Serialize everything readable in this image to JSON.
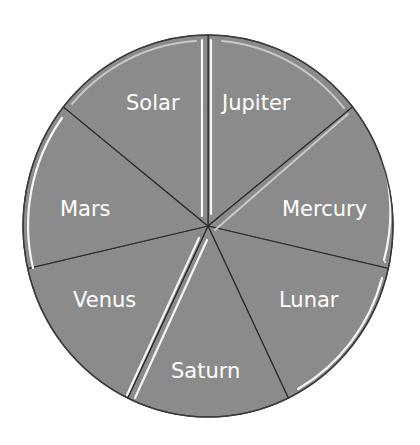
{
  "chart_data": {
    "type": "pie",
    "title": "",
    "start_angle_deg": 0,
    "direction": "clockwise",
    "categories": [
      "Jupiter",
      "Mercury",
      "Lunar",
      "Saturn",
      "Venus",
      "Mars",
      "Solar"
    ],
    "values": [
      1,
      1,
      1,
      1,
      1,
      1,
      1
    ],
    "percentages": [
      14.3,
      14.3,
      14.3,
      14.3,
      14.3,
      14.3,
      14.3
    ],
    "legend": "none",
    "data_labels": "category name inside slice",
    "colors": {
      "fill": "#8b8b8b",
      "outline": "#2b2b2b",
      "highlight": "#f4f4f4",
      "label_text": "#ffffff"
    }
  },
  "labels": {
    "jupiter": "Jupiter",
    "mercury": "Mercury",
    "lunar": "Lunar",
    "saturn": "Saturn",
    "venus": "Venus",
    "mars": "Mars",
    "solar": "Solar"
  }
}
